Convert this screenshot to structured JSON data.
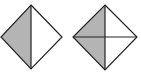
{
  "diagram": {
    "colors": {
      "fill": "#b4b4b4",
      "stroke": "#222222",
      "background": "#ffffff"
    },
    "shapes": [
      {
        "name": "diamond-halves",
        "divisions": 2,
        "shaded_parts": 1,
        "lines": [
          "vertical"
        ],
        "shaded": "left half"
      },
      {
        "name": "diamond-quarters",
        "divisions": 4,
        "shaded_parts": 2,
        "lines": [
          "vertical",
          "horizontal"
        ],
        "shaded": "upper-left and lower-left quarters"
      }
    ]
  }
}
